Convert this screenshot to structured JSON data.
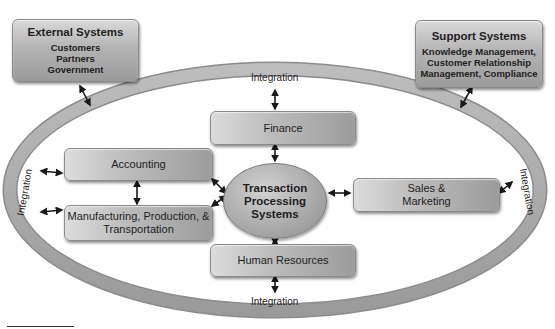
{
  "diagram": {
    "type": "system-context",
    "ring_label": "Integration",
    "integration_labels": {
      "top": "Integration",
      "bottom": "Integration",
      "left": "Integration",
      "right": "Integration"
    },
    "external_systems": {
      "title": "External Systems",
      "items": [
        "Customers",
        "Partners",
        "Government"
      ]
    },
    "support_systems": {
      "title": "Support Systems",
      "lines": [
        "Knowledge Management,",
        "Customer Relationship",
        "Management, Compliance"
      ]
    },
    "center": {
      "lines": [
        "Transaction",
        "Processing",
        "Systems"
      ]
    },
    "functions": {
      "finance": "Finance",
      "accounting": "Accounting",
      "manufacturing": [
        "Manufacturing, Production, &",
        "Transportation"
      ],
      "sales": [
        "Sales &",
        "Marketing"
      ],
      "human_resources": "Human Resources"
    },
    "colors": {
      "ring": "#a9a9a9",
      "box_light": "#d9d9d9",
      "box_dark": "#9b9b9b",
      "text": "#1e1e1e",
      "arrow": "#1a1a1a"
    }
  }
}
